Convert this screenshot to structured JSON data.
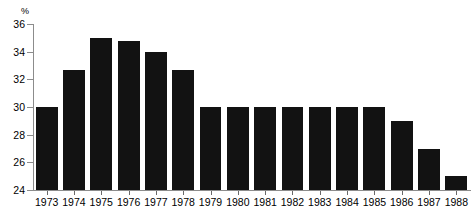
{
  "chart_data": {
    "type": "bar",
    "title": "...the late income tax",
    "subtitle": "",
    "xlabel": "",
    "ylabel": "%",
    "ylim": [
      24,
      36
    ],
    "ytick_labels": [
      "24",
      "26",
      "28",
      "30",
      "32",
      "34",
      "36"
    ],
    "yticks": [
      24,
      26,
      28,
      30,
      32,
      34,
      36
    ],
    "grid": false,
    "legend": "none",
    "bar_color": "#121212",
    "axis_color": "#8c8c8c",
    "categories": [
      "1973",
      "1974",
      "1975",
      "1976",
      "1977",
      "1978",
      "1979",
      "1980",
      "1981",
      "1982",
      "1983",
      "1984",
      "1985",
      "1986",
      "1987",
      "1988"
    ],
    "values": [
      30.0,
      32.7,
      35.0,
      34.8,
      34.0,
      32.7,
      30.0,
      30.0,
      30.0,
      30.0,
      30.0,
      30.0,
      30.0,
      29.0,
      27.0,
      25.0
    ]
  }
}
